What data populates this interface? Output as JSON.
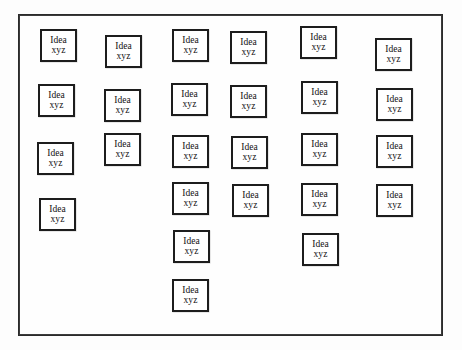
{
  "diagram": {
    "background_color": "#fdfdfd",
    "frame": {
      "name": "board-frame",
      "x": 18,
      "y": 14,
      "width": 425,
      "height": 322,
      "border_color": "#2b2b2b",
      "fill_color": "#fefefe"
    },
    "card_style": {
      "border_color": "#1d1d1d",
      "fill_color": "#ffffff",
      "text_color": "#111111"
    },
    "card_count": 26,
    "columns": [
      {
        "index": 1,
        "card_count": 4
      },
      {
        "index": 2,
        "card_count": 3
      },
      {
        "index": 3,
        "card_count": 6
      },
      {
        "index": 4,
        "card_count": 4
      },
      {
        "index": 5,
        "card_count": 5
      },
      {
        "index": 6,
        "card_count": 4
      }
    ],
    "cards": [
      {
        "id": "c1-1",
        "line1": "Idea",
        "line2": "xyz",
        "x": 40,
        "y": 29,
        "w": 37,
        "h": 33,
        "column": 1,
        "row": 1
      },
      {
        "id": "c1-2",
        "line1": "Idea",
        "line2": "xyz",
        "x": 38,
        "y": 84,
        "w": 37,
        "h": 33,
        "column": 1,
        "row": 2
      },
      {
        "id": "c1-3",
        "line1": "Idea",
        "line2": "xyz",
        "x": 37,
        "y": 142,
        "w": 37,
        "h": 33,
        "column": 1,
        "row": 3
      },
      {
        "id": "c1-4",
        "line1": "Idea",
        "line2": "xyz",
        "x": 39,
        "y": 198,
        "w": 37,
        "h": 33,
        "column": 1,
        "row": 4
      },
      {
        "id": "c2-1",
        "line1": "Idea",
        "line2": "xyz",
        "x": 105,
        "y": 35,
        "w": 37,
        "h": 33,
        "column": 2,
        "row": 1
      },
      {
        "id": "c2-2",
        "line1": "Idea",
        "line2": "xyz",
        "x": 104,
        "y": 89,
        "w": 37,
        "h": 33,
        "column": 2,
        "row": 2
      },
      {
        "id": "c2-3",
        "line1": "Idea",
        "line2": "xyz",
        "x": 104,
        "y": 133,
        "w": 37,
        "h": 33,
        "column": 2,
        "row": 3
      },
      {
        "id": "c3-1",
        "line1": "Idea",
        "line2": "xyz",
        "x": 172,
        "y": 29,
        "w": 37,
        "h": 33,
        "column": 3,
        "row": 1
      },
      {
        "id": "c3-2",
        "line1": "Idea",
        "line2": "xyz",
        "x": 171,
        "y": 83,
        "w": 37,
        "h": 33,
        "column": 3,
        "row": 2
      },
      {
        "id": "c3-3",
        "line1": "Idea",
        "line2": "xyz",
        "x": 172,
        "y": 135,
        "w": 37,
        "h": 33,
        "column": 3,
        "row": 3
      },
      {
        "id": "c3-4",
        "line1": "Idea",
        "line2": "xyz",
        "x": 172,
        "y": 182,
        "w": 37,
        "h": 33,
        "column": 3,
        "row": 4
      },
      {
        "id": "c3-5",
        "line1": "Idea",
        "line2": "xyz",
        "x": 173,
        "y": 230,
        "w": 37,
        "h": 33,
        "column": 3,
        "row": 5
      },
      {
        "id": "c3-6",
        "line1": "Idea",
        "line2": "xyz",
        "x": 172,
        "y": 279,
        "w": 37,
        "h": 33,
        "column": 3,
        "row": 6
      },
      {
        "id": "c4-1",
        "line1": "Idea",
        "line2": "xyz",
        "x": 230,
        "y": 31,
        "w": 37,
        "h": 33,
        "column": 4,
        "row": 1
      },
      {
        "id": "c4-2",
        "line1": "Idea",
        "line2": "xyz",
        "x": 230,
        "y": 85,
        "w": 37,
        "h": 33,
        "column": 4,
        "row": 2
      },
      {
        "id": "c4-3",
        "line1": "Idea",
        "line2": "xyz",
        "x": 231,
        "y": 136,
        "w": 37,
        "h": 33,
        "column": 4,
        "row": 3
      },
      {
        "id": "c4-4",
        "line1": "Idea",
        "line2": "xyz",
        "x": 232,
        "y": 184,
        "w": 37,
        "h": 33,
        "column": 4,
        "row": 4
      },
      {
        "id": "c5-1",
        "line1": "Idea",
        "line2": "xyz",
        "x": 300,
        "y": 26,
        "w": 37,
        "h": 33,
        "column": 5,
        "row": 1
      },
      {
        "id": "c5-2",
        "line1": "Idea",
        "line2": "xyz",
        "x": 301,
        "y": 81,
        "w": 37,
        "h": 33,
        "column": 5,
        "row": 2
      },
      {
        "id": "c5-3",
        "line1": "Idea",
        "line2": "xyz",
        "x": 301,
        "y": 133,
        "w": 37,
        "h": 33,
        "column": 5,
        "row": 3
      },
      {
        "id": "c5-4",
        "line1": "Idea",
        "line2": "xyz",
        "x": 301,
        "y": 183,
        "w": 37,
        "h": 33,
        "column": 5,
        "row": 4
      },
      {
        "id": "c5-5",
        "line1": "Idea",
        "line2": "xyz",
        "x": 302,
        "y": 233,
        "w": 37,
        "h": 33,
        "column": 5,
        "row": 5
      },
      {
        "id": "c6-1",
        "line1": "Idea",
        "line2": "xyz",
        "x": 375,
        "y": 38,
        "w": 37,
        "h": 33,
        "column": 6,
        "row": 1
      },
      {
        "id": "c6-2",
        "line1": "Idea",
        "line2": "xyz",
        "x": 376,
        "y": 88,
        "w": 37,
        "h": 33,
        "column": 6,
        "row": 2
      },
      {
        "id": "c6-3",
        "line1": "Idea",
        "line2": "xyz",
        "x": 376,
        "y": 135,
        "w": 37,
        "h": 33,
        "column": 6,
        "row": 3
      },
      {
        "id": "c6-4",
        "line1": "Idea",
        "line2": "xyz",
        "x": 376,
        "y": 184,
        "w": 37,
        "h": 33,
        "column": 6,
        "row": 4
      }
    ]
  }
}
